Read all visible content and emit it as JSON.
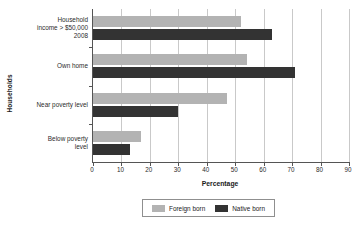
{
  "chart_data": {
    "type": "bar",
    "orientation": "horizontal",
    "title": "",
    "xlabel": "Percentage",
    "ylabel": "Households",
    "xlim": [
      0,
      90
    ],
    "xticks": [
      0,
      10,
      20,
      30,
      40,
      50,
      60,
      70,
      80,
      90
    ],
    "grid": true,
    "legend_position": "bottom",
    "categories": [
      "Household income > $50,000 2008",
      "Own home",
      "Near poverty level",
      "Below poverty level"
    ],
    "category_lines": [
      [
        "Household",
        "income > $50,000",
        "2008"
      ],
      [
        "Own home"
      ],
      [
        "Near poverty level"
      ],
      [
        "Below poverty",
        "level"
      ]
    ],
    "series": [
      {
        "name": "Foreign born",
        "color": "#b3b3b3",
        "values": [
          52,
          54,
          47,
          17
        ]
      },
      {
        "name": "Native born",
        "color": "#333333",
        "values": [
          63,
          71,
          30,
          13
        ]
      }
    ]
  },
  "axis": {
    "x_title": "Percentage",
    "y_title": "Households",
    "tick_labels": [
      "0",
      "10",
      "20",
      "30",
      "40",
      "50",
      "60",
      "70",
      "80",
      "90"
    ]
  },
  "legend": {
    "items": [
      {
        "label": "Foreign born",
        "color": "#b3b3b3"
      },
      {
        "label": "Native born",
        "color": "#333333"
      }
    ]
  }
}
